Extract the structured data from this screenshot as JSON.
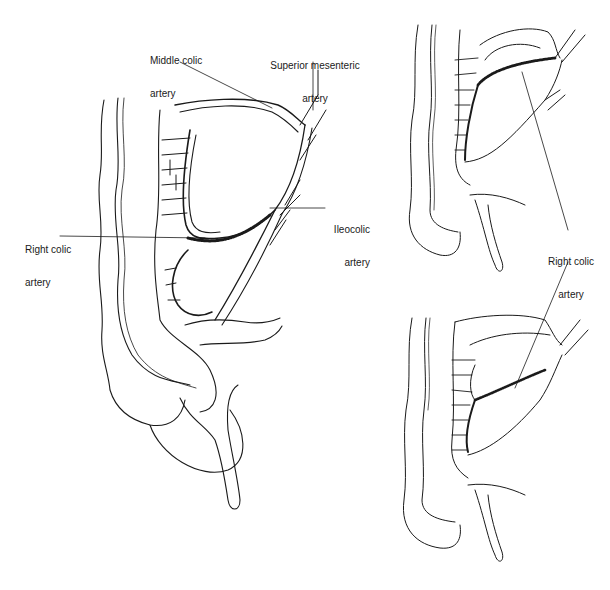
{
  "figure": {
    "panels": [
      {
        "id": "main",
        "labels": [
          {
            "name": "middle-colic-artery",
            "line1": "Middle colic",
            "line2": "artery"
          },
          {
            "name": "superior-mesenteric-artery",
            "line1": "Superior mesenteric",
            "line2": "artery"
          },
          {
            "name": "ileocolic-artery",
            "line1": "Ileocolic",
            "line2": "artery"
          },
          {
            "name": "right-colic-artery",
            "line1": "Right colic",
            "line2": "artery"
          }
        ]
      },
      {
        "id": "variants",
        "labels": [
          {
            "name": "right-colic-artery-variant",
            "line1": "Right colic",
            "line2": "artery"
          }
        ]
      }
    ],
    "colors": {
      "ink": "#1a1a1a",
      "background": "#ffffff"
    }
  }
}
